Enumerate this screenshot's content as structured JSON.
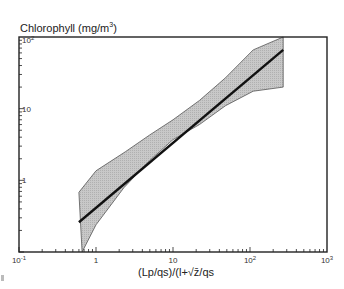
{
  "chart_data": {
    "type": "line",
    "title_text": "Chlorophyll  (mg/m",
    "title_sup": "3",
    "title_close": ")",
    "xlabel": "(Lp/qs)/(l+√z̄/qs",
    "ylabel": "Chlorophyll (mg/m³)",
    "x_scale": "log",
    "y_scale": "log",
    "xlim": [
      0.1,
      1000
    ],
    "ylim": [
      0.1,
      100
    ],
    "x_ticks": [
      {
        "value": 0.1,
        "label": "10",
        "sup": "-1"
      },
      {
        "value": 1,
        "label": "1",
        "sup": ""
      },
      {
        "value": 10,
        "label": "10",
        "sup": ""
      },
      {
        "value": 100,
        "label": "10",
        "sup": "2"
      },
      {
        "value": 1000,
        "label": "10",
        "sup": "3"
      }
    ],
    "y_ticks": [
      {
        "value": 1,
        "label": "1",
        "sup": ""
      },
      {
        "value": 10,
        "label": "10",
        "sup": ""
      },
      {
        "value": 100,
        "label": "10",
        "sup": "2"
      }
    ],
    "grid": false,
    "series": [
      {
        "name": "regression line",
        "x": [
          0.6,
          270
        ],
        "y": [
          0.26,
          66
        ]
      }
    ],
    "confidence_band": {
      "name": "prediction interval",
      "upper": {
        "x": [
          0.6,
          1.0,
          2.4,
          5.0,
          10,
          22,
          48,
          110,
          270
        ],
        "y": [
          0.68,
          1.36,
          2.5,
          4.3,
          7.0,
          13,
          27,
          66,
          100
        ]
      },
      "lower": {
        "x": [
          0.66,
          1.0,
          2.3,
          5.0,
          10,
          22,
          48,
          110,
          270
        ],
        "y": [
          0.1,
          0.24,
          0.79,
          1.9,
          3.7,
          6.0,
          11.0,
          17.5,
          20
        ]
      }
    },
    "colors": {
      "band_fill": "#c8c8c8",
      "band_edge": "#555555",
      "line": "#111111",
      "axis": "#222222"
    }
  }
}
